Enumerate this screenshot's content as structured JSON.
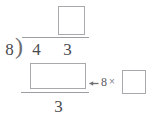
{
  "problem": {
    "type": "long-division",
    "divisor": "8",
    "dividend_digits": [
      "4",
      "3"
    ],
    "remainder": "3",
    "quotient_box_value": "",
    "product_box_value": "",
    "multiplier_box_value": ""
  },
  "bracket": {
    "curve_glyph": ")"
  },
  "annotation": {
    "arrow_icon": "left-arrow-icon",
    "factor": "8",
    "times_symbol": "×"
  },
  "colors": {
    "digit": "#4a4a4e",
    "box_border": "#a9a9ad",
    "rule": "#9d9da2",
    "annotation": "#6e6e73",
    "background": "#ffffff"
  }
}
